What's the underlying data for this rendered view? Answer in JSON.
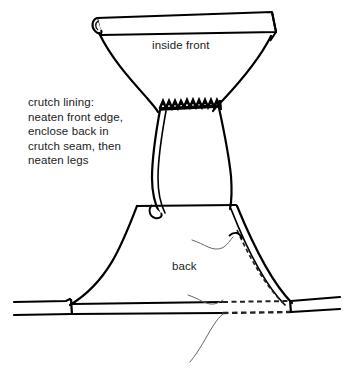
{
  "figure": {
    "kind": "sewing-construction-diagram",
    "background_color": "#ffffff",
    "ink_color": "#000000",
    "line_color_light": "#555555"
  },
  "labels": {
    "inside_front": "inside front",
    "back": "back",
    "crutch_lining": "crutch lining:\nneaten front edge,\nenclose back in\ncrutch seam, then\nneaten legs"
  },
  "annotations": {
    "crutch_seam_stitching": "zigzag-overlock-stitch-band",
    "side_seam_stitching": "dashed-stitch-line",
    "hem_stitching": "dashed-stitch-line",
    "leader_lines": 3
  }
}
